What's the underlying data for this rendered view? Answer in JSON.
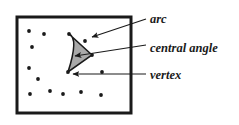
{
  "figure": {
    "background_color": "#ffffff",
    "box": {
      "x": 17,
      "y": 17,
      "width": 114,
      "height": 96,
      "stroke_color": "#1a1a1a",
      "stroke_width": 3,
      "fill_color": "#ffffff"
    },
    "pegs": {
      "color": "#1a1a1a",
      "radius": 1.9,
      "points": [
        {
          "x": 29,
          "y": 31
        },
        {
          "x": 44,
          "y": 34
        },
        {
          "x": 69,
          "y": 34
        },
        {
          "x": 32,
          "y": 47
        },
        {
          "x": 85,
          "y": 41
        },
        {
          "x": 29,
          "y": 68
        },
        {
          "x": 92,
          "y": 55
        },
        {
          "x": 38,
          "y": 79
        },
        {
          "x": 68,
          "y": 72
        },
        {
          "x": 102,
          "y": 72
        },
        {
          "x": 30,
          "y": 94
        },
        {
          "x": 50,
          "y": 91
        },
        {
          "x": 63,
          "y": 94
        },
        {
          "x": 81,
          "y": 92
        },
        {
          "x": 101,
          "y": 95
        }
      ]
    },
    "sector": {
      "fill_color": "#a9a9a9",
      "stroke_color": "#1a1a1a",
      "stroke_width": 1.6,
      "vertex": {
        "x": 92,
        "y": 55
      },
      "arc_start": {
        "x": 69,
        "y": 34
      },
      "arc_mid": {
        "x": 79,
        "y": 38
      },
      "arc_end": {
        "x": 68,
        "y": 72
      }
    },
    "annotations": [
      {
        "id": "arc",
        "label": "arc",
        "label_x": 150,
        "label_y": 23,
        "arrow_from": {
          "x": 146,
          "y": 19
        },
        "arrow_to": {
          "x": 92,
          "y": 37
        },
        "arrow_color": "#1a1a1a"
      },
      {
        "id": "central-angle",
        "label": "central angle",
        "label_x": 150,
        "label_y": 52,
        "arrow_from": {
          "x": 146,
          "y": 45
        },
        "arrow_to": {
          "x": 75,
          "y": 56
        },
        "arrow_color": "#1a1a1a"
      },
      {
        "id": "vertex",
        "label": "vertex",
        "label_x": 150,
        "label_y": 79,
        "arrow_from": {
          "x": 146,
          "y": 74
        },
        "arrow_to": {
          "x": 73,
          "y": 74
        },
        "arrow_color": "#1a1a1a"
      }
    ],
    "leader_lines": {
      "color": "#1a1a1a",
      "width": 1.1
    }
  }
}
